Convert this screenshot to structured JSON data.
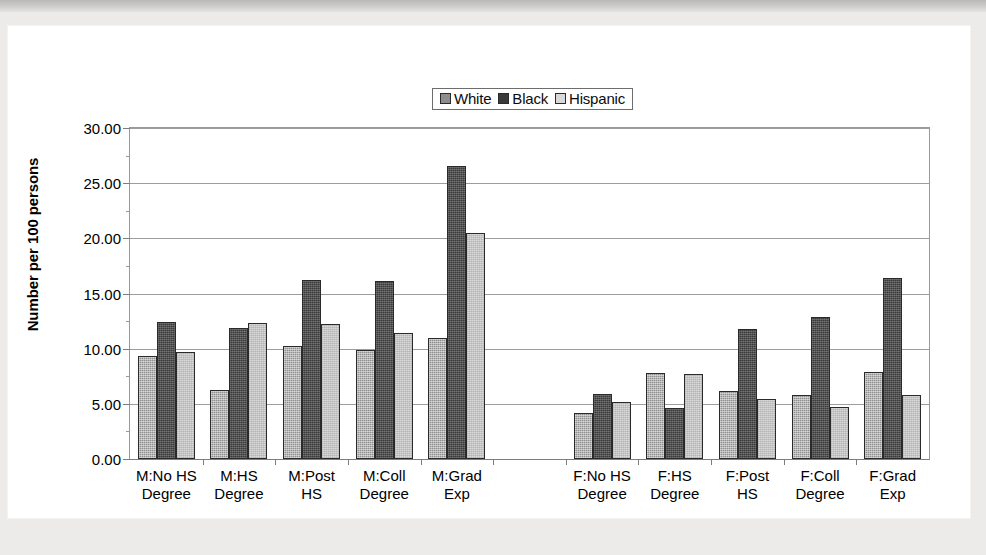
{
  "chart_data": {
    "type": "bar",
    "title": "",
    "xlabel": "",
    "ylabel": "Number per 100 persons",
    "ylim": [
      0,
      30
    ],
    "ytick_step": 5,
    "ytick_labels": [
      "0.00",
      "5.00",
      "10.00",
      "15.00",
      "20.00",
      "25.00",
      "30.00"
    ],
    "grid": true,
    "legend_position": "top-center",
    "categories": [
      "M:No HS Degree",
      "M:HS Degree",
      "M:Post HS",
      "M:Coll Degree",
      "M:Grad Exp",
      "",
      "F:No HS Degree",
      "F:HS Degree",
      "F:Post HS",
      "F:Coll Degree",
      "F:Grad Exp"
    ],
    "category_lines": [
      [
        "M:No HS",
        "Degree"
      ],
      [
        "M:HS",
        "Degree"
      ],
      [
        "M:Post",
        "HS"
      ],
      [
        "M:Coll",
        "Degree"
      ],
      [
        "M:Grad",
        "Exp"
      ],
      [
        "",
        ""
      ],
      [
        "F:No HS",
        "Degree"
      ],
      [
        "F:HS",
        "Degree"
      ],
      [
        "F:Post",
        "HS"
      ],
      [
        "F:Coll",
        "Degree"
      ],
      [
        "F:Grad",
        "Exp"
      ]
    ],
    "series": [
      {
        "name": "White",
        "color": "#8e8e8e",
        "values": [
          9.3,
          6.3,
          10.2,
          9.9,
          11.0,
          null,
          4.2,
          7.8,
          6.2,
          5.8,
          7.9
        ]
      },
      {
        "name": "Black",
        "color": "#3a3a3a",
        "values": [
          12.4,
          11.9,
          16.2,
          16.1,
          26.6,
          null,
          5.9,
          4.6,
          11.8,
          12.9,
          16.4
        ]
      },
      {
        "name": "Hispanic",
        "color": "#d9d9d9",
        "values": [
          9.7,
          12.3,
          12.2,
          11.4,
          20.5,
          null,
          5.2,
          7.7,
          5.4,
          4.7,
          5.8
        ]
      }
    ]
  },
  "legend": {
    "items": [
      {
        "label": "White",
        "color": "#8e8e8e"
      },
      {
        "label": "Black",
        "color": "#3a3a3a"
      },
      {
        "label": "Hispanic",
        "color": "#d9d9d9"
      }
    ]
  }
}
